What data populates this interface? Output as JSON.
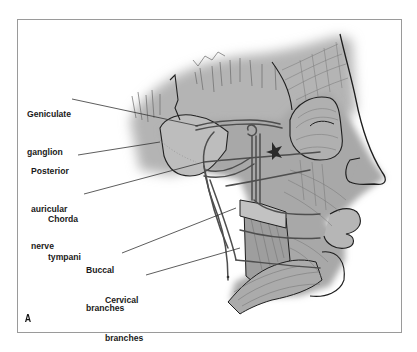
{
  "figure": {
    "panel_label": "A",
    "labels": [
      {
        "id": "geniculate",
        "line1": "Geniculate",
        "line2": "ganglion"
      },
      {
        "id": "posterior-auricular",
        "line1": "Posterior",
        "line2": "auricular",
        "line3": "nerve"
      },
      {
        "id": "chorda",
        "line1": "Chorda",
        "line2": "tympani"
      },
      {
        "id": "buccal",
        "line1": "Buccal",
        "line2": "branches"
      },
      {
        "id": "cervical",
        "line1": "Cervical",
        "line2": "branches"
      }
    ]
  },
  "colors": {
    "background": "#ffffff",
    "frame": "#9a9a9a",
    "tissue": "#a9a9a9",
    "tissue_light": "#c4c4c4",
    "outline": "#1e1e1e",
    "nerve": "#555555",
    "leader": "#333333"
  }
}
